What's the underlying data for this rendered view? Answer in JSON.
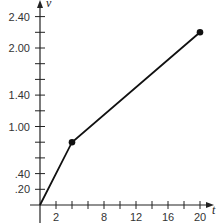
{
  "chart_data": {
    "type": "line",
    "title": "",
    "xlabel": "t",
    "ylabel": "v",
    "xlim": [
      0,
      21
    ],
    "ylim": [
      0,
      2.5
    ],
    "grid": false,
    "legend": null,
    "x_ticks": [
      2,
      4,
      6,
      8,
      10,
      12,
      14,
      16,
      18,
      20
    ],
    "x_tick_labels": [
      "2",
      "",
      "",
      "8",
      "",
      "12",
      "",
      "16",
      "",
      "20"
    ],
    "y_ticks": [
      0.2,
      0.4,
      0.6,
      0.8,
      1.0,
      1.2,
      1.4,
      1.6,
      1.8,
      2.0,
      2.2,
      2.4
    ],
    "y_tick_labels": [
      ".20",
      ".40",
      "",
      "",
      "1.00",
      "",
      "1.40",
      "",
      "",
      "2.00",
      "",
      "2.40"
    ],
    "series": [
      {
        "name": "segment",
        "x": [
          0,
          4,
          20
        ],
        "y": [
          0,
          0.8,
          2.2
        ],
        "markers": [
          false,
          true,
          true
        ]
      }
    ],
    "colors": {
      "line": "#111111",
      "axis": "#222222",
      "text": "#333333"
    }
  }
}
